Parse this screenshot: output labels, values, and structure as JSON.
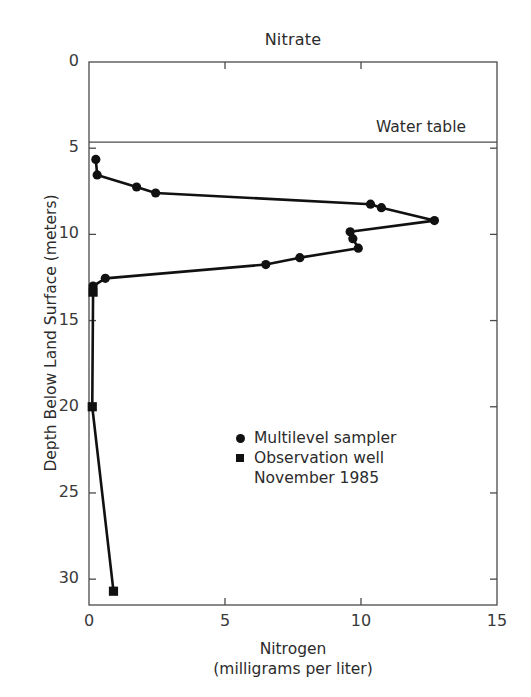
{
  "chart_data": {
    "type": "line",
    "title": "Nitrate",
    "xlabel": "Nitrogen",
    "xlabel_sub": "(milligrams per liter)",
    "ylabel": "Depth Below Land Surface (meters)",
    "xlim": [
      0,
      15
    ],
    "ylim": [
      0,
      31.5
    ],
    "y_inverted": true,
    "grid": false,
    "xticks": [
      0,
      5,
      10,
      15
    ],
    "xtick_labels": [
      "0",
      "5",
      "10",
      "15"
    ],
    "yticks": [
      0,
      5,
      10,
      15,
      20,
      25,
      30
    ],
    "ytick_labels": [
      "0",
      "5",
      "10",
      "15",
      "20",
      "25",
      "30"
    ],
    "annotations": [
      {
        "name": "water-table",
        "label": "Water table",
        "depth": 4.65,
        "type": "horizontal-line"
      }
    ],
    "legend": {
      "position": "center",
      "entries": [
        {
          "marker": "circle",
          "label": "Multilevel sampler"
        },
        {
          "marker": "square",
          "label": "Observation well"
        }
      ],
      "note": "November 1985"
    },
    "series": [
      {
        "name": "Multilevel sampler",
        "marker": "circle",
        "color": "#111111",
        "points": [
          {
            "nitrogen": 0.25,
            "depth": 5.65
          },
          {
            "nitrogen": 0.3,
            "depth": 6.55
          },
          {
            "nitrogen": 1.75,
            "depth": 7.25
          },
          {
            "nitrogen": 2.45,
            "depth": 7.6
          },
          {
            "nitrogen": 10.35,
            "depth": 8.25
          },
          {
            "nitrogen": 10.75,
            "depth": 8.45
          },
          {
            "nitrogen": 12.7,
            "depth": 9.2
          },
          {
            "nitrogen": 9.6,
            "depth": 9.85
          },
          {
            "nitrogen": 9.7,
            "depth": 10.25
          },
          {
            "nitrogen": 9.9,
            "depth": 10.8
          },
          {
            "nitrogen": 7.75,
            "depth": 11.35
          },
          {
            "nitrogen": 6.5,
            "depth": 11.75
          },
          {
            "nitrogen": 0.6,
            "depth": 12.55
          },
          {
            "nitrogen": 0.15,
            "depth": 13.0
          }
        ]
      },
      {
        "name": "Observation well",
        "marker": "square",
        "color": "#111111",
        "points": [
          {
            "nitrogen": 0.15,
            "depth": 13.35
          },
          {
            "nitrogen": 0.12,
            "depth": 20.0
          },
          {
            "nitrogen": 0.9,
            "depth": 30.7
          }
        ]
      }
    ]
  },
  "accent_color": "#111111",
  "axis_color": "#4a4a4a"
}
